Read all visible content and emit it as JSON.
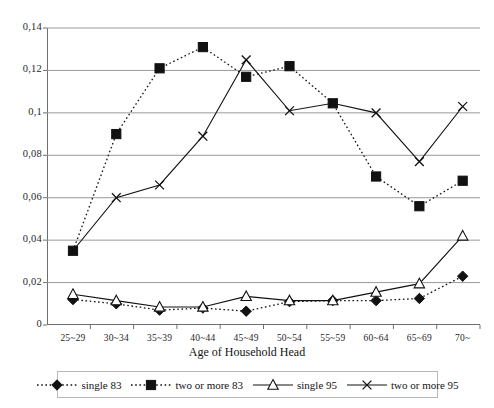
{
  "chart_data": {
    "type": "line",
    "title": "",
    "xlabel": "Age of Household Head",
    "ylabel": "",
    "categories": [
      "25~29",
      "30~34",
      "35~39",
      "40~44",
      "45~49",
      "50~54",
      "55~59",
      "60~64",
      "65~69",
      "70~"
    ],
    "ylim": [
      0,
      0.14
    ],
    "yticks": [
      0,
      0.02,
      0.04,
      0.06,
      0.08,
      0.1,
      0.12,
      0.14
    ],
    "ytick_labels": [
      "0",
      "0,02",
      "0,04",
      "0,06",
      "0,08",
      "0,1",
      "0,12",
      "0,14"
    ],
    "grid": "horizontal",
    "legend_position": "bottom",
    "series": [
      {
        "name": "single 83",
        "marker": "filled-diamond",
        "line": "dotted",
        "color": "#111111",
        "values": [
          0.012,
          0.01,
          0.007,
          0.008,
          0.0065,
          0.011,
          0.0115,
          0.0115,
          0.0125,
          0.023
        ]
      },
      {
        "name": "two or more 83",
        "marker": "filled-square",
        "line": "dotted",
        "color": "#111111",
        "values": [
          0.035,
          0.09,
          0.121,
          0.131,
          0.117,
          0.122,
          0.1045,
          0.07,
          0.056,
          0.068
        ]
      },
      {
        "name": "single 95",
        "marker": "open-triangle",
        "line": "solid",
        "color": "#111111",
        "values": [
          0.0145,
          0.0115,
          0.0085,
          0.0085,
          0.0135,
          0.0115,
          0.0115,
          0.0155,
          0.0195,
          0.042
        ]
      },
      {
        "name": "two or more 95",
        "marker": "cross-x",
        "line": "solid",
        "color": "#111111",
        "values": [
          0.035,
          0.06,
          0.066,
          0.089,
          0.125,
          0.101,
          0.1045,
          0.1,
          0.077,
          0.103
        ]
      }
    ]
  },
  "legend": {
    "items": [
      {
        "label": "single 83"
      },
      {
        "label": "two or more 83"
      },
      {
        "label": "single 95"
      },
      {
        "label": "two or more 95"
      }
    ]
  }
}
